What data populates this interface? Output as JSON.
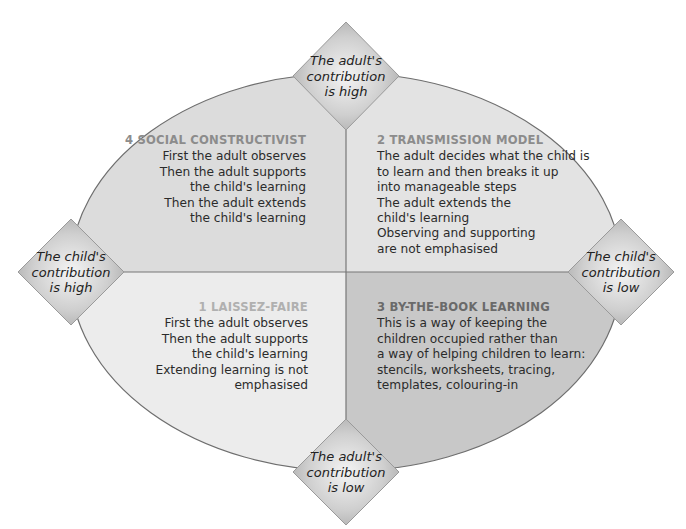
{
  "colors": {
    "q4_fill": "#dcdcdc",
    "q2_fill": "#e3e3e3",
    "q1_fill": "#ececec",
    "q3_fill": "#c8c8c8",
    "outline": "#6e6e6e",
    "divider": "#777777",
    "title_q4": "#8c8c8c",
    "title_q2": "#8c8c8c",
    "title_q1": "#b0b0b0",
    "title_q3": "#6a6a6a"
  },
  "axes": {
    "top": {
      "lines": [
        "The adult's",
        "contribution",
        "is high"
      ]
    },
    "bottom": {
      "lines": [
        "The adult's",
        "contribution",
        "is low"
      ]
    },
    "left": {
      "lines": [
        "The child's",
        "contribution",
        "is high"
      ]
    },
    "right": {
      "lines": [
        "The child's",
        "contribution",
        "is low"
      ]
    }
  },
  "quadrants": {
    "q4": {
      "title": "4  SOCIAL CONSTRUCTIVIST",
      "lines": [
        "First the adult observes",
        "Then the adult supports",
        "the child's learning",
        "Then the adult extends",
        "the child's learning"
      ]
    },
    "q2": {
      "title": "2  TRANSMISSION MODEL",
      "lines": [
        "The adult decides what the child is",
        "to learn and then breaks it up",
        "into manageable steps",
        "The adult extends the",
        "child's learning",
        "Observing and supporting",
        "are not emphasised"
      ]
    },
    "q1": {
      "title": "1  LAISSEZ-FAIRE",
      "lines": [
        "First the adult observes",
        "Then the adult supports",
        "the child's learning",
        "Extending learning is not",
        "emphasised"
      ]
    },
    "q3": {
      "title": "3  BY-THE-BOOK LEARNING",
      "lines": [
        "This is a way of keeping the",
        "children occupied rather than",
        "a way of helping children to learn:",
        "stencils, worksheets, tracing,",
        "templates, colouring-in"
      ]
    }
  }
}
